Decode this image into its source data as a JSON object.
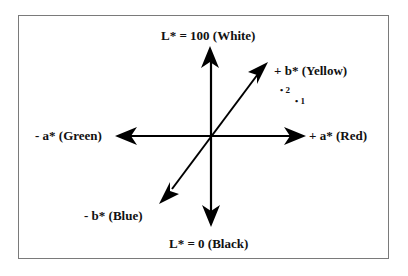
{
  "diagram": {
    "axes": {
      "L_top": "L*  = 100  (White)",
      "L_bottom": "L* = 0  (Black)",
      "a_neg": "- a*  (Green)",
      "a_pos": "+ a*  (Red)",
      "b_pos": "+ b*  (Yellow)",
      "b_neg": "- b*  (Blue)"
    },
    "points": [
      {
        "label": "2",
        "marker": "•"
      },
      {
        "label": "1",
        "marker": "•"
      }
    ],
    "colors": {
      "stroke": "#000000",
      "frame": "#7a7a7a",
      "background": "#ffffff"
    }
  }
}
